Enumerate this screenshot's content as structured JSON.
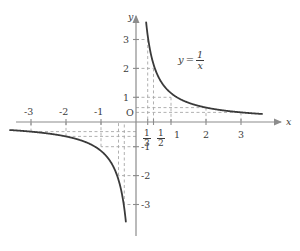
{
  "figure": {
    "title": "",
    "equation_label": {
      "lhs": "y",
      "eq": "=",
      "numerator": "1",
      "denominator": "x"
    },
    "axis_labels": {
      "x": "x",
      "y": "y",
      "origin": "O"
    },
    "colors": {
      "curve": "#3a3a3a",
      "axis": "#8c8c8c",
      "dashed": "#a8a8a8",
      "text": "#3b3b3b",
      "background": "#ffffff"
    },
    "x_ticks_negative": [
      {
        "label": "-3",
        "value": -3
      },
      {
        "label": "-2",
        "value": -2
      },
      {
        "label": "-1",
        "value": -1
      }
    ],
    "x_ticks_positive": [
      {
        "label": "1",
        "value": 1
      },
      {
        "label": "2",
        "value": 2
      },
      {
        "label": "3",
        "value": 3
      }
    ],
    "x_ticks_fraction": [
      {
        "numerator": "1",
        "denominator": "3",
        "value": 0.3333
      },
      {
        "numerator": "1",
        "denominator": "2",
        "value": 0.5
      }
    ],
    "y_ticks_positive": [
      {
        "label": "1",
        "value": 1
      },
      {
        "label": "2",
        "value": 2
      },
      {
        "label": "3",
        "value": 3
      }
    ],
    "y_ticks_negative": [
      {
        "label": "-1",
        "value": -1
      },
      {
        "label": "-2",
        "value": -2
      },
      {
        "label": "-3",
        "value": -3
      }
    ]
  },
  "chart_data": {
    "type": "line",
    "title": "",
    "function": "y = 1/x",
    "xlabel": "x",
    "ylabel": "y",
    "xlim": [
      -3.7,
      3.8
    ],
    "ylim": [
      -3.7,
      3.7
    ],
    "grid": false,
    "legend": "none",
    "annotations": [
      {
        "text": "y = 1/x",
        "x": 1.9,
        "y": 2.3
      },
      {
        "text": "O",
        "x": -0.22,
        "y": 0.2
      }
    ],
    "xticks": [
      -3,
      -2,
      -1,
      0.3333,
      0.5,
      1,
      2,
      3
    ],
    "xticklabels": [
      "-3",
      "-2",
      "-1",
      "1/3",
      "1/2",
      "1",
      "2",
      "3"
    ],
    "yticks": [
      -3,
      -2,
      -1,
      1,
      2,
      3
    ],
    "yticklabels": [
      "-3",
      "-2",
      "-1",
      "1",
      "2",
      "3"
    ],
    "guide_points": [
      {
        "x": 0.3333,
        "y": 3
      },
      {
        "x": 0.5,
        "y": 2
      },
      {
        "x": 1,
        "y": 1
      },
      {
        "x": 2,
        "y": 0.5
      },
      {
        "x": 3,
        "y": 0.3333
      },
      {
        "x": -0.3333,
        "y": -3
      },
      {
        "x": -0.5,
        "y": -2
      },
      {
        "x": -1,
        "y": -1
      },
      {
        "x": -2,
        "y": -0.5
      },
      {
        "x": -3,
        "y": -0.3333
      }
    ],
    "series": [
      {
        "name": "y = 1/x (branch x>0)",
        "x": [
          0.29,
          0.32,
          0.36,
          0.4,
          0.45,
          0.5,
          0.6,
          0.7,
          0.8,
          0.9,
          1.0,
          1.2,
          1.4,
          1.6,
          1.8,
          2.0,
          2.4,
          2.8,
          3.2,
          3.6
        ],
        "y": [
          3.45,
          3.13,
          2.78,
          2.5,
          2.22,
          2.0,
          1.67,
          1.43,
          1.25,
          1.11,
          1.0,
          0.83,
          0.71,
          0.63,
          0.56,
          0.5,
          0.42,
          0.36,
          0.31,
          0.28
        ]
      },
      {
        "name": "y = 1/x (branch x<0)",
        "x": [
          -3.6,
          -3.2,
          -2.8,
          -2.4,
          -2.0,
          -1.8,
          -1.6,
          -1.4,
          -1.2,
          -1.0,
          -0.9,
          -0.8,
          -0.7,
          -0.6,
          -0.5,
          -0.45,
          -0.4,
          -0.36,
          -0.32,
          -0.29
        ],
        "y": [
          -0.28,
          -0.31,
          -0.36,
          -0.42,
          -0.5,
          -0.56,
          -0.63,
          -0.71,
          -0.83,
          -1.0,
          -1.11,
          -1.25,
          -1.43,
          -1.67,
          -2.0,
          -2.22,
          -2.5,
          -2.78,
          -3.13,
          -3.45
        ]
      }
    ]
  }
}
